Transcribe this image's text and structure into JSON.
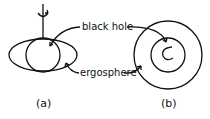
{
  "labels": {
    "black_hole": "black hole",
    "ergosphere": "ergosphere",
    "panel_a": "(a)",
    "panel_b": "(b)"
  }
}
